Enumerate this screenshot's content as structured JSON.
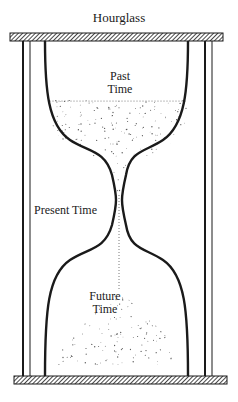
{
  "title": "Hourglass",
  "labels": {
    "past": [
      "Past",
      "Time"
    ],
    "present": "Present Time",
    "future": [
      "Future",
      "Time"
    ]
  },
  "colors": {
    "ink": "#1a1a1a",
    "sand": "#555555",
    "background": "#ffffff"
  }
}
